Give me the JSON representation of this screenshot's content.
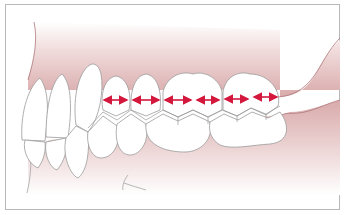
{
  "diagram": {
    "colors": {
      "frame_border": "#b8b8b8",
      "gum": "#d9aaab",
      "gum_fade": "#ffffff",
      "tooth_fill": "#ffffff",
      "tooth_outline": "#9a9a9a",
      "gum_outline": "#b07a7c",
      "arrow": "#d4173d"
    },
    "upper_teeth_count": 9,
    "lower_teeth_count": 8,
    "arrows": [
      {
        "x1": 103,
        "x2": 128,
        "y": 100
      },
      {
        "x1": 132,
        "x2": 160,
        "y": 100
      },
      {
        "x1": 164,
        "x2": 192,
        "y": 100
      },
      {
        "x1": 196,
        "x2": 220,
        "y": 100
      },
      {
        "x1": 224,
        "x2": 249,
        "y": 99
      },
      {
        "x1": 253,
        "x2": 278,
        "y": 97
      }
    ]
  }
}
